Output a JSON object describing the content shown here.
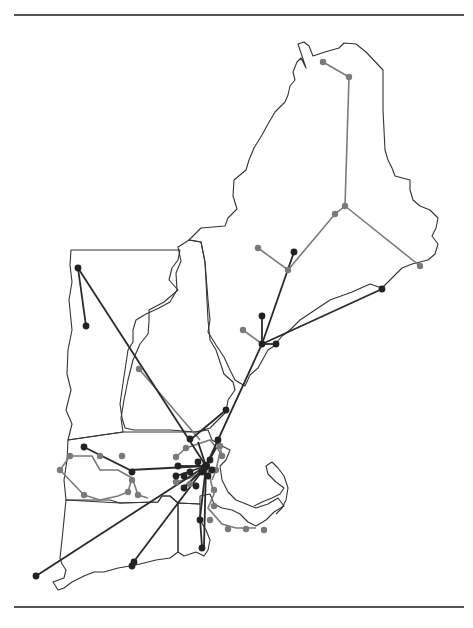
{
  "figure": {
    "region": "New England",
    "states": [
      "Maine",
      "New Hampshire",
      "Vermont",
      "Massachusetts",
      "Rhode Island",
      "Connecticut"
    ],
    "hub": "Boston",
    "colors": {
      "state_outline": "#333333",
      "route_series_a": "#7a7a7a",
      "route_series_b": "#2a2a2a",
      "rule": "#555555"
    },
    "series": [
      {
        "name": "gray-network",
        "color": "#7a7a7a"
      },
      {
        "name": "dark-network",
        "color": "#2a2a2a"
      }
    ]
  }
}
